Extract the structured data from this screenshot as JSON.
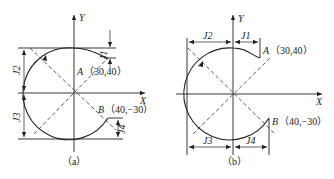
{
  "figures": [
    {
      "id": "a",
      "caption": "（a）",
      "axis_x_label": "X",
      "axis_y_label": "Y",
      "point_a": {
        "name": "A",
        "coord": "（30,40）"
      },
      "point_b": {
        "name": "B",
        "coord": "（40,−30）"
      },
      "dimensions": [
        "J1",
        "J2",
        "J3",
        "J4"
      ]
    },
    {
      "id": "b",
      "caption": "（b）",
      "axis_x_label": "X",
      "axis_y_label": "Y",
      "point_a": {
        "name": "A",
        "coord": "（30,40）"
      },
      "point_b": {
        "name": "B",
        "coord": "（40,−30）"
      },
      "dimensions": [
        "J1",
        "J2",
        "J3",
        "J4"
      ]
    }
  ],
  "colors": {
    "stroke": "#222222",
    "background": "#ffffff"
  }
}
